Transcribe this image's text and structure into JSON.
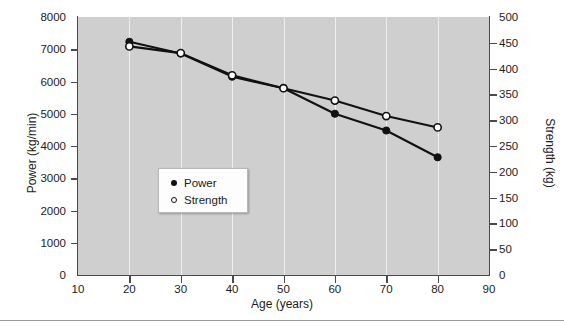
{
  "chart_data": {
    "type": "line",
    "title": "",
    "xlabel": "Age (years)",
    "ylabel": "Power (kg/min)",
    "ylabel_right": "Strength (kg)",
    "xlim": [
      10,
      90
    ],
    "ylim": [
      0,
      8000
    ],
    "ylim_right": [
      0,
      500
    ],
    "grid": true,
    "legend_position": "center-left",
    "x": [
      20,
      30,
      40,
      50,
      60,
      70,
      80
    ],
    "xticks": [
      10,
      20,
      30,
      40,
      50,
      60,
      70,
      80,
      90
    ],
    "yticks_left": [
      0,
      1000,
      2000,
      3000,
      4000,
      5000,
      6000,
      7000,
      8000
    ],
    "yticks_right": [
      0,
      50,
      100,
      150,
      200,
      250,
      300,
      350,
      400,
      450,
      500
    ],
    "series": [
      {
        "name": "Power",
        "axis": "left",
        "marker": "filled-circle",
        "color": "#111111",
        "values": [
          7230,
          6870,
          6150,
          5790,
          5000,
          4480,
          3650
        ]
      },
      {
        "name": "Strength",
        "axis": "right",
        "marker": "open-circle",
        "color": "#111111",
        "values": [
          443,
          430,
          387,
          362,
          338,
          308,
          286
        ]
      }
    ]
  },
  "legend": {
    "items": [
      {
        "label": "Power",
        "marker": "filled-circle"
      },
      {
        "label": "Strength",
        "marker": "open-circle"
      }
    ]
  },
  "colors": {
    "plot_background": "#cfcfcf",
    "gridline": "#efefef",
    "axis": "#4a4a4a",
    "text": "#1c1c1c",
    "legend_background": "#fdfdfd",
    "page_background": "#ffffff"
  }
}
